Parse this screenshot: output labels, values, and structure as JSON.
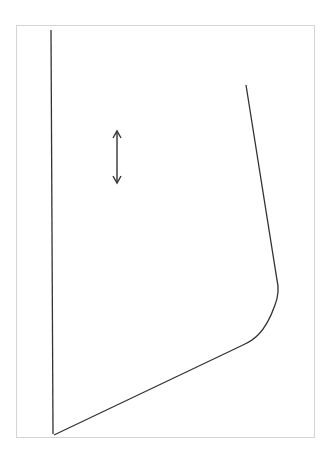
{
  "figure": {
    "stroke_color": "#333333",
    "frame_color": "#d4d4d4",
    "arrow": {
      "direction": "vertical",
      "type": "double-headed"
    }
  }
}
